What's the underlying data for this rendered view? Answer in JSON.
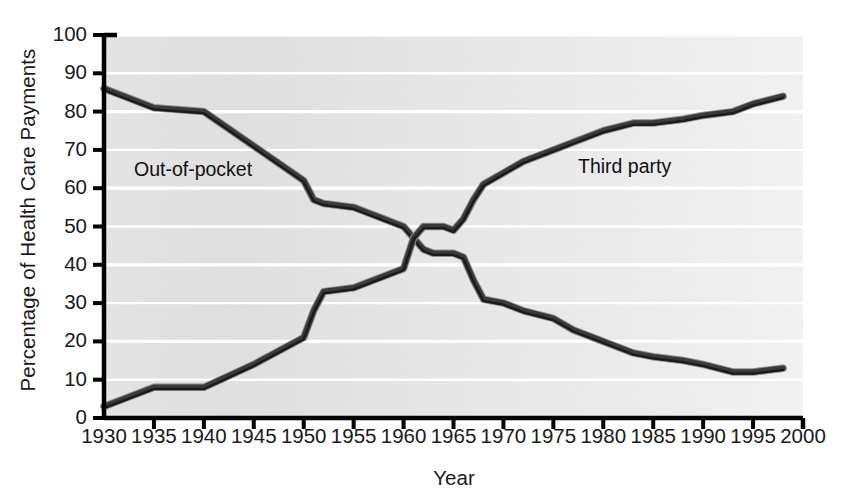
{
  "chart_data": {
    "type": "line",
    "title": "",
    "xlabel": "Year",
    "ylabel": "Percentage of Health Care Payments",
    "xlim": [
      1930,
      2000
    ],
    "ylim": [
      0,
      100
    ],
    "grid": "horizontal-white-lines",
    "legend_position": "inline-annotations",
    "xticks": [
      1930,
      1935,
      1940,
      1945,
      1950,
      1955,
      1960,
      1965,
      1970,
      1975,
      1980,
      1985,
      1990,
      1995,
      2000
    ],
    "yticks": [
      0,
      10,
      20,
      30,
      40,
      50,
      60,
      70,
      80,
      90,
      100
    ],
    "xtick_labels": [
      "1930",
      "1935",
      "1940",
      "1945",
      "1950",
      "1955",
      "1960",
      "1965",
      "1970",
      "1975",
      "1980",
      "1985",
      "1990",
      "1995",
      "2000"
    ],
    "ytick_labels": [
      "0",
      "10",
      "20",
      "30",
      "40",
      "50",
      "60",
      "70",
      "80",
      "90",
      "100"
    ],
    "series": [
      {
        "name": "Out-of-pocket",
        "color": "#3a3a3a",
        "label_x": 1941,
        "label_y": 64,
        "x": [
          1930,
          1935,
          1940,
          1945,
          1950,
          1951,
          1952,
          1955,
          1958,
          1960,
          1961,
          1962,
          1963,
          1964,
          1965,
          1966,
          1967,
          1968,
          1970,
          1972,
          1975,
          1977,
          1980,
          1983,
          1985,
          1988,
          1990,
          1993,
          1995,
          1998
        ],
        "values": [
          86,
          81,
          80,
          71,
          62,
          57,
          56,
          55,
          52,
          50,
          47,
          44,
          43,
          43,
          43,
          42,
          36,
          31,
          30,
          28,
          26,
          23,
          20,
          17,
          16,
          15,
          14,
          12,
          12,
          13
        ]
      },
      {
        "name": "Third party",
        "color": "#3a3a3a",
        "label_x": 1973,
        "label_y": 65,
        "x": [
          1930,
          1935,
          1940,
          1945,
          1950,
          1951,
          1952,
          1955,
          1958,
          1960,
          1961,
          1962,
          1963,
          1964,
          1965,
          1966,
          1967,
          1968,
          1970,
          1972,
          1975,
          1977,
          1980,
          1983,
          1985,
          1988,
          1990,
          1993,
          1995,
          1998
        ],
        "values": [
          3,
          8,
          8,
          14,
          21,
          28,
          33,
          34,
          37,
          39,
          47,
          50,
          50,
          50,
          49,
          52,
          57,
          61,
          64,
          67,
          70,
          72,
          75,
          77,
          77,
          78,
          79,
          80,
          82,
          84
        ]
      }
    ]
  },
  "annotations": {
    "out_of_pocket_label": "Out-of-pocket",
    "third_party_label": "Third party"
  },
  "axes": {
    "x_title": "Year",
    "y_title": "Percentage of Health Care Payments"
  },
  "colors": {
    "line": "#3a3a3a",
    "line_outline": "#1a1a1a",
    "axis": "#000000",
    "plot_bg_light": "#eeeeee",
    "plot_bg_dark": "#dcdcdc",
    "gridline": "#ffffff",
    "text": "#1a1a1a"
  }
}
